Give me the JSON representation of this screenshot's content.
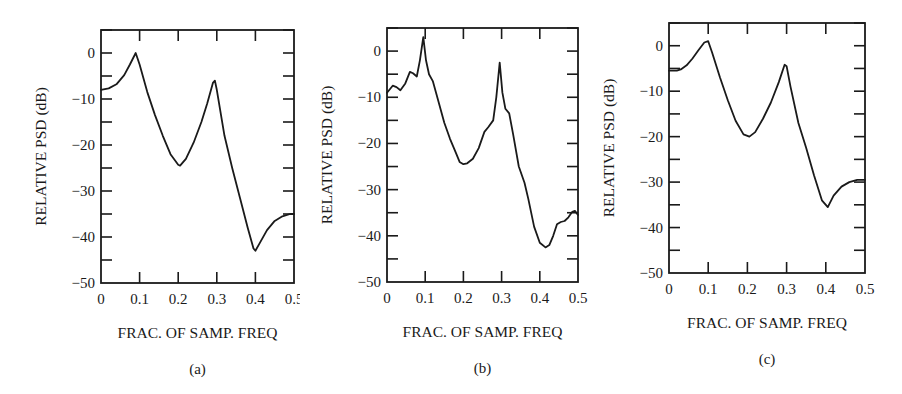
{
  "figure": {
    "panels": [
      {
        "id": "a",
        "caption": "(a)",
        "xlabel": "FRAC. OF SAMP. FREQ",
        "ylabel": "RELATIVE PSD (dB)"
      },
      {
        "id": "b",
        "caption": "(b)",
        "xlabel": "FRAC. OF SAMP. FREQ",
        "ylabel": "RELATIVE PSD (dB)"
      },
      {
        "id": "c",
        "caption": "(c)",
        "xlabel": "FRAC. OF SAMP. FREQ",
        "ylabel": "RELATIVE PSD (dB)"
      }
    ],
    "colors": {
      "line": "#1a1a1a",
      "background": "#ffffff"
    }
  },
  "chart_data": [
    {
      "type": "line",
      "title": "(a)",
      "xlabel": "FRAC. OF SAMP. FREQ",
      "ylabel": "RELATIVE PSD (dB)",
      "xlim": [
        0,
        0.5
      ],
      "ylim": [
        -50,
        5
      ],
      "xticks": [
        0,
        0.1,
        0.2,
        0.3,
        0.4,
        0.5
      ],
      "xtick_labels": [
        "0",
        "0.1",
        "0.2",
        "0.3",
        "0.4",
        "0.5"
      ],
      "yticks": [
        0,
        -10,
        -20,
        -30,
        -40,
        -50
      ],
      "ytick_labels": [
        "0",
        "−10",
        "−20",
        "−30",
        "−40",
        "−50"
      ],
      "grid": false,
      "series": [
        {
          "name": "PSD (a)",
          "x": [
            0,
            0.02,
            0.04,
            0.06,
            0.075,
            0.09,
            0.1,
            0.12,
            0.14,
            0.16,
            0.18,
            0.2,
            0.205,
            0.22,
            0.24,
            0.26,
            0.275,
            0.29,
            0.295,
            0.3,
            0.32,
            0.34,
            0.36,
            0.38,
            0.395,
            0.4,
            0.41,
            0.43,
            0.45,
            0.47,
            0.49,
            0.5
          ],
          "y": [
            -8,
            -7.7,
            -6.8,
            -4.8,
            -2.5,
            0,
            -2.5,
            -8.5,
            -13.5,
            -18,
            -22,
            -24.3,
            -24.5,
            -23,
            -19.5,
            -15,
            -11,
            -6.5,
            -6,
            -8,
            -18,
            -25,
            -31.5,
            -38,
            -42.5,
            -43,
            -41.5,
            -38.5,
            -36.5,
            -35.5,
            -35,
            -35
          ]
        }
      ]
    },
    {
      "type": "line",
      "title": "(b)",
      "xlabel": "FRAC. OF SAMP. FREQ",
      "ylabel": "RELATIVE PSD (dB)",
      "xlim": [
        0,
        0.5
      ],
      "ylim": [
        -50,
        5
      ],
      "xticks": [
        0,
        0.1,
        0.2,
        0.3,
        0.4,
        0.5
      ],
      "xtick_labels": [
        "0",
        "0.1",
        "0.2",
        "0.3",
        "0.4",
        "0.5"
      ],
      "yticks": [
        0,
        -10,
        -20,
        -30,
        -40,
        -50
      ],
      "ytick_labels": [
        "0",
        "−10",
        "−20",
        "−30",
        "−40",
        "−50"
      ],
      "grid": false,
      "series": [
        {
          "name": "PSD (b)",
          "x": [
            0,
            0.015,
            0.025,
            0.035,
            0.048,
            0.06,
            0.068,
            0.078,
            0.086,
            0.095,
            0.102,
            0.11,
            0.12,
            0.135,
            0.15,
            0.165,
            0.18,
            0.19,
            0.2,
            0.21,
            0.225,
            0.24,
            0.255,
            0.265,
            0.278,
            0.286,
            0.295,
            0.302,
            0.31,
            0.32,
            0.33,
            0.345,
            0.36,
            0.37,
            0.385,
            0.4,
            0.415,
            0.425,
            0.435,
            0.445,
            0.455,
            0.465,
            0.475,
            0.485,
            0.492,
            0.5
          ],
          "y": [
            -9,
            -7.5,
            -7.8,
            -8.5,
            -7,
            -4.5,
            -4.8,
            -5.5,
            -2,
            3,
            -2,
            -5,
            -6.5,
            -11,
            -15.5,
            -19,
            -22,
            -24,
            -24.5,
            -24.3,
            -23.3,
            -21,
            -17.5,
            -16.5,
            -15,
            -10,
            -2.5,
            -9,
            -12.5,
            -13.5,
            -18,
            -25,
            -28.5,
            -32,
            -38,
            -41.5,
            -42.5,
            -42,
            -40,
            -37.5,
            -37,
            -36.8,
            -36,
            -34.8,
            -34.6,
            -35.5
          ]
        }
      ]
    },
    {
      "type": "line",
      "title": "(c)",
      "xlabel": "FRAC. OF SAMP. FREQ",
      "ylabel": "RELATIVE PSD (dB)",
      "xlim": [
        0,
        0.5
      ],
      "ylim": [
        -50,
        5
      ],
      "xticks": [
        0,
        0.1,
        0.2,
        0.3,
        0.4,
        0.5
      ],
      "xtick_labels": [
        "0",
        "0.1",
        "0.2",
        "0.3",
        "0.4",
        "0.5"
      ],
      "yticks": [
        0,
        -10,
        -20,
        -30,
        -40,
        -50
      ],
      "ytick_labels": [
        "0",
        "−10",
        "−20",
        "−30",
        "−40",
        "−50"
      ],
      "grid": false,
      "series": [
        {
          "name": "PSD (c)",
          "x": [
            0,
            0.02,
            0.03,
            0.045,
            0.06,
            0.075,
            0.09,
            0.1,
            0.11,
            0.13,
            0.15,
            0.17,
            0.19,
            0.205,
            0.22,
            0.24,
            0.26,
            0.28,
            0.295,
            0.3,
            0.31,
            0.33,
            0.35,
            0.37,
            0.39,
            0.405,
            0.42,
            0.44,
            0.46,
            0.48,
            0.5
          ],
          "y": [
            -5.5,
            -5.5,
            -5.2,
            -4.3,
            -2.8,
            -1,
            0.7,
            1,
            -1.5,
            -7,
            -12,
            -16.5,
            -19.5,
            -20,
            -19,
            -16,
            -12.5,
            -8,
            -4.2,
            -4.5,
            -9,
            -17,
            -22.5,
            -28.5,
            -34,
            -35.5,
            -33,
            -31,
            -30,
            -29.5,
            -29.5
          ]
        }
      ]
    }
  ]
}
